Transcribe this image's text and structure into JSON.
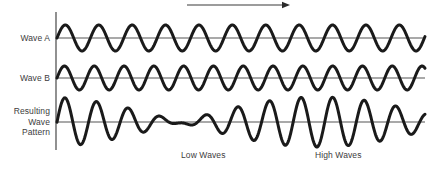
{
  "figure": {
    "background_color": "#ffffff",
    "wave_color": "#1a1a1a",
    "axis_color": "#555555",
    "text_color": "#3c3c3c"
  },
  "labels": {
    "wave_a": "Wave A",
    "wave_b": "Wave B",
    "resulting_line1": "Resulting",
    "resulting_line2": "Wave",
    "resulting_line3": "Pattern",
    "low_waves": "Low Waves",
    "high_waves": "High Waves"
  },
  "arrow": {
    "name": "direction-arrow",
    "x_start": 187,
    "x_end": 290,
    "y": 5,
    "direction": "right"
  },
  "chart_data": {
    "type": "line",
    "xlabel": "",
    "ylabel": "",
    "grid": false,
    "legend": "none",
    "plot_x_start": 57,
    "plot_x_end": 425,
    "axis_x": 56,
    "axis_y_top": 12,
    "axis_y_bottom": 150,
    "series": [
      {
        "name": "Wave A",
        "baseline_y": 38,
        "amplitude": 13,
        "wavelength": 33.4,
        "phase_deg": 0,
        "tick_labels": [
          "Low Waves",
          "High Waves"
        ]
      },
      {
        "name": "Wave B",
        "baseline_y": 78,
        "amplitude": 12,
        "wavelength": 29.8,
        "phase_deg": 0,
        "tick_labels": []
      },
      {
        "name": "Resulting Wave Pattern",
        "baseline_y": 122,
        "amplitude_max": 25,
        "amplitude_min": 3,
        "node_x": 210,
        "wavelength": 31.5,
        "description": "Superposition of Wave A and Wave B producing beats",
        "tick_labels": []
      }
    ],
    "annotations": [
      {
        "text": "Low Waves",
        "x": 210,
        "y": 155
      },
      {
        "text": "High Waves",
        "x": 345,
        "y": 155
      }
    ]
  }
}
